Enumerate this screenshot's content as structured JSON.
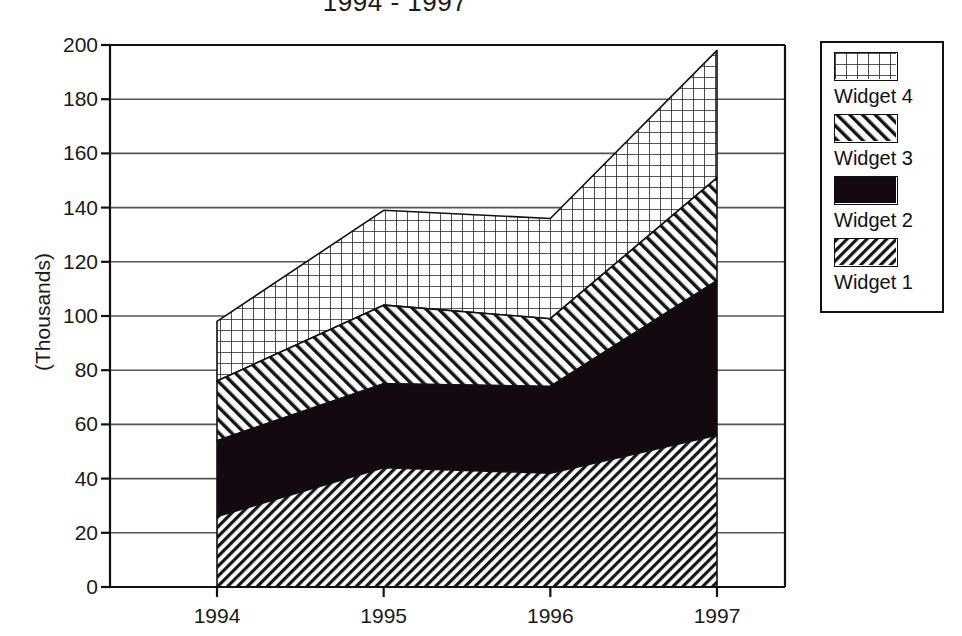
{
  "chart_data": {
    "type": "area",
    "stacked": true,
    "title": "1994 - 1997",
    "xlabel": "",
    "ylabel": "(Thousands)",
    "categories": [
      "1994",
      "1995",
      "1996",
      "1997"
    ],
    "ylim": [
      0,
      200
    ],
    "ytick_values": [
      0,
      20,
      40,
      60,
      80,
      100,
      120,
      140,
      160,
      180,
      200
    ],
    "ytick_labels": [
      "0",
      "20",
      "40",
      "60",
      "80",
      "100",
      "120",
      "140",
      "160",
      "180",
      "200"
    ],
    "grid": true,
    "grid_axis": "y",
    "legend_position": "right",
    "series": [
      {
        "name": "Widget 1",
        "pattern": "diagonal-hatch-down",
        "values": [
          26,
          44,
          42,
          56
        ],
        "cumulative": [
          26,
          44,
          42,
          56
        ]
      },
      {
        "name": "Widget 2",
        "pattern": "solid-black",
        "values": [
          28,
          31,
          32,
          57
        ],
        "cumulative": [
          54,
          75,
          74,
          113
        ]
      },
      {
        "name": "Widget 3",
        "pattern": "diagonal-hatch-up",
        "values": [
          22,
          29,
          25,
          38
        ],
        "cumulative": [
          76,
          104,
          99,
          151
        ]
      },
      {
        "name": "Widget 4",
        "pattern": "cross-grid",
        "values": [
          22,
          35,
          37,
          47
        ],
        "cumulative": [
          98,
          139,
          136,
          198
        ]
      }
    ],
    "totals": [
      98,
      139,
      136,
      198
    ]
  },
  "legend": {
    "entries": [
      {
        "label": "Widget 4",
        "pattern": "cross-grid"
      },
      {
        "label": "Widget 3",
        "pattern": "diagonal-hatch-up"
      },
      {
        "label": "Widget 2",
        "pattern": "solid-black"
      },
      {
        "label": "Widget 1",
        "pattern": "diagonal-hatch-down"
      }
    ]
  },
  "colors": {
    "axis": "#111111",
    "grid": "#555555",
    "fill_black": "#120a10",
    "background": "#ffffff"
  }
}
